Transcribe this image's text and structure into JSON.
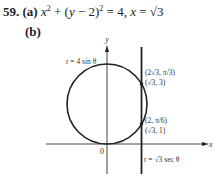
{
  "problem": {
    "number": "59.",
    "part_a_label": "(a)",
    "part_a_equation_parts": {
      "x": "x",
      "sq1": "2",
      "mid": " + (",
      "y": "y",
      "minus": " − 2)",
      "sq2": "2",
      "eq": " = 4, ",
      "x2": "x",
      "eq2": " = √3"
    },
    "part_b_label": "(b)"
  },
  "figure": {
    "y_axis_label": "y",
    "x_axis_label": "x",
    "origin_label": "0",
    "circle_label": "r = 4 sin θ",
    "line_label": "r = √3 sec θ",
    "point_upper_polar": "(2√3, π/3)",
    "point_upper_rect": "(√3, 3)",
    "point_lower_polar": "(2, π/6)",
    "point_lower_rect": "(√3, 1)"
  }
}
